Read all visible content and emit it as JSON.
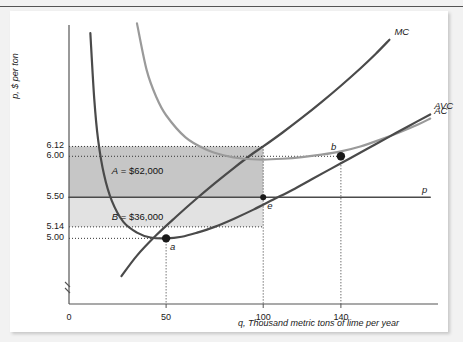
{
  "figure": {
    "background_color": "#f2f2f2",
    "panel_color": "#ffffff"
  },
  "chart_data": {
    "type": "line",
    "title": "",
    "xlabel": "q, Thousand metric tons of lime per year",
    "ylabel": "p, $ per ton",
    "xlim": [
      0,
      190
    ],
    "ylim": [
      4.2,
      7.6
    ],
    "grid": false,
    "legend_position": "curve-end-labels",
    "xticks": [
      "0",
      "50",
      "100",
      "140"
    ],
    "xtick_values": [
      0,
      50,
      100,
      140
    ],
    "yticks": [
      "6.12",
      "6.00",
      "5.50",
      "5.14",
      "5.00"
    ],
    "ytick_values": [
      6.12,
      6.0,
      5.5,
      5.14,
      5.0
    ],
    "axis_break": true,
    "series": [
      {
        "name": "MC",
        "label": "MC",
        "color": "#4a4a4a",
        "width": 2.2,
        "points": [
          [
            27,
            4.54
          ],
          [
            35,
            4.79
          ],
          [
            45,
            5.04
          ],
          [
            55,
            5.26
          ],
          [
            65,
            5.47
          ],
          [
            75,
            5.67
          ],
          [
            85,
            5.86
          ],
          [
            95,
            6.04
          ],
          [
            100,
            6.12
          ],
          [
            110,
            6.29
          ],
          [
            120,
            6.47
          ],
          [
            130,
            6.66
          ],
          [
            140,
            6.86
          ],
          [
            150,
            7.07
          ],
          [
            158,
            7.25
          ],
          [
            165,
            7.42
          ]
        ]
      },
      {
        "name": "AC",
        "label": "AC",
        "color": "#9a9a9a",
        "width": 2.2,
        "points": [
          [
            35,
            7.62
          ],
          [
            40,
            7.05
          ],
          [
            45,
            6.72
          ],
          [
            50,
            6.5
          ],
          [
            60,
            6.23
          ],
          [
            70,
            6.09
          ],
          [
            80,
            6.01
          ],
          [
            90,
            5.97
          ],
          [
            100,
            5.96
          ],
          [
            110,
            5.97
          ],
          [
            120,
            5.99
          ],
          [
            130,
            6.02
          ],
          [
            140,
            6.06
          ],
          [
            150,
            6.12
          ],
          [
            160,
            6.2
          ],
          [
            170,
            6.29
          ],
          [
            180,
            6.39
          ],
          [
            186,
            6.46
          ]
        ]
      },
      {
        "name": "AVC",
        "label": "AVC",
        "color": "#4a4a4a",
        "width": 2.2,
        "points": [
          [
            11,
            7.5
          ],
          [
            13,
            6.7
          ],
          [
            15,
            6.2
          ],
          [
            18,
            5.78
          ],
          [
            22,
            5.46
          ],
          [
            28,
            5.2
          ],
          [
            35,
            5.07
          ],
          [
            42,
            5.01
          ],
          [
            50,
            5.0
          ],
          [
            58,
            5.02
          ],
          [
            66,
            5.07
          ],
          [
            75,
            5.14
          ],
          [
            85,
            5.24
          ],
          [
            95,
            5.35
          ],
          [
            105,
            5.47
          ],
          [
            115,
            5.59
          ],
          [
            125,
            5.72
          ],
          [
            135,
            5.85
          ],
          [
            145,
            5.98
          ],
          [
            155,
            6.11
          ],
          [
            165,
            6.24
          ],
          [
            175,
            6.37
          ],
          [
            186,
            6.51
          ]
        ]
      },
      {
        "name": "p",
        "label": "p",
        "color": "#4a4a4a",
        "width": 1.6,
        "points": [
          [
            0,
            5.5
          ],
          [
            186,
            5.5
          ]
        ]
      }
    ],
    "points_of_interest": [
      {
        "name": "a",
        "label": "a",
        "x": 50,
        "y": 5.0,
        "marker": "dot",
        "label_pos": "below-right"
      },
      {
        "name": "b",
        "label": "b",
        "x": 140,
        "y": 6.0,
        "marker": "dot",
        "label_pos": "above-left"
      },
      {
        "name": "e",
        "label": "e",
        "x": 100,
        "y": 5.5,
        "marker": "dot-small",
        "label_pos": "below-right"
      }
    ],
    "shaded_areas": [
      {
        "name": "A",
        "label": "A = $62,000",
        "label_symbol": "A",
        "label_value": "= $62,000",
        "color": "#c6c6c6",
        "x_range": [
          0,
          100
        ],
        "y_range": [
          5.5,
          6.12
        ]
      },
      {
        "name": "B",
        "label": "B = $36,000",
        "label_symbol": "B",
        "label_value": "= $36,000",
        "color": "#e2e2e2",
        "x_range": [
          0,
          100
        ],
        "y_range": [
          5.14,
          5.5
        ]
      }
    ],
    "dotted_guides": [
      {
        "orientation": "horizontal",
        "value": 6.12,
        "to_x": 100
      },
      {
        "orientation": "horizontal",
        "value": 6.0,
        "to_x": 140
      },
      {
        "orientation": "horizontal",
        "value": 5.14,
        "to_x": 100
      },
      {
        "orientation": "horizontal",
        "value": 5.0,
        "to_x": 50
      },
      {
        "orientation": "vertical",
        "value": 50,
        "to_y": 5.0
      },
      {
        "orientation": "vertical",
        "value": 100,
        "to_y": 6.12
      },
      {
        "orientation": "vertical",
        "value": 140,
        "to_y": 6.0
      }
    ]
  }
}
